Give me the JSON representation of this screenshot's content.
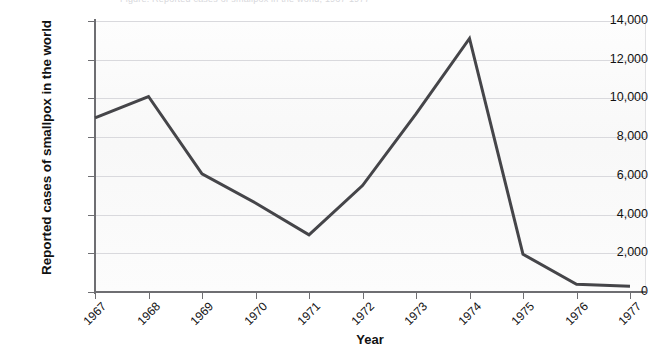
{
  "figure": {
    "top_caption_sliver": "Figure. Reported cases of smallpox in the world, 1967-1977",
    "background_color": "#fbfbfb",
    "gridline_color": "#d9d9dd",
    "axis_color": "#6e6e72",
    "line_color": "#454549"
  },
  "chart_data": {
    "type": "line",
    "title": "",
    "xlabel": "Year",
    "ylabel": "Reported cases of smallpox in the world",
    "categories": [
      "1967",
      "1968",
      "1969",
      "1970",
      "1971",
      "1972",
      "1973",
      "1974",
      "1975",
      "1976",
      "1977"
    ],
    "x": [
      1967,
      1968,
      1969,
      1970,
      1971,
      1972,
      1973,
      1974,
      1975,
      1976,
      1977
    ],
    "values": [
      9000,
      10100,
      6100,
      4600,
      2950,
      5500,
      9200,
      13100,
      1950,
      400,
      300
    ],
    "series": [
      {
        "name": "Reported cases of smallpox",
        "values": [
          9000,
          10100,
          6100,
          4600,
          2950,
          5500,
          9200,
          13100,
          1950,
          400,
          300
        ]
      }
    ],
    "ylim": [
      0,
      14000
    ],
    "ytick_values": [
      0,
      2000,
      4000,
      6000,
      8000,
      10000,
      12000,
      14000
    ],
    "ytick_labels": [
      "0",
      "2,000",
      "4,000",
      "6,000",
      "8,000",
      "10,000",
      "12,000",
      "14,000"
    ],
    "xtick_labels": [
      "1967",
      "1968",
      "1969",
      "1970",
      "1971",
      "1972",
      "1973",
      "1974",
      "1975",
      "1976",
      "1977"
    ],
    "grid": true,
    "grid_axis": "y",
    "legend": false,
    "legend_position": "none",
    "markers": false,
    "line_width": 3,
    "annotations": []
  }
}
